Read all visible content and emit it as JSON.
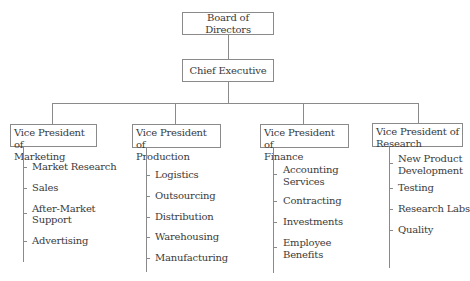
{
  "chart_title": "",
  "top": {
    "board": "Board of Directors",
    "ceo": "Chief Executive"
  },
  "divisions": [
    {
      "vp_line1": "Vice President of",
      "vp_line2": "Marketing",
      "items": [
        "Market Research",
        "Sales",
        "After-Market",
        "Support",
        "Advertising"
      ]
    },
    {
      "vp_line1": "Vice President of",
      "vp_line2": "Production",
      "items": [
        "Logistics",
        "Outsourcing",
        "Distribution",
        "Warehousing",
        "Manufacturing"
      ]
    },
    {
      "vp_line1": "Vice President of",
      "vp_line2": "Finance",
      "items": [
        "Accounting",
        "Services",
        "Contracting",
        "Investments",
        "Employee",
        "Benefits"
      ]
    },
    {
      "vp_line1": "Vice President of",
      "vp_line2": "Research",
      "items": [
        "New Product",
        "Development",
        "Testing",
        "Research Labs",
        "Quality"
      ]
    }
  ],
  "colors": {
    "line": "#8a8a8a",
    "text": "#3a3a3a",
    "background": "#ffffff"
  }
}
